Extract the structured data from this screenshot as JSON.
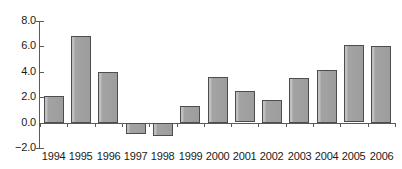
{
  "chart_data": {
    "type": "bar",
    "title": "",
    "subtitle": "",
    "xlabel": "",
    "ylabel": "",
    "categories": [
      "1994",
      "1995",
      "1996",
      "1997",
      "1998",
      "1999",
      "2000",
      "2001",
      "2002",
      "2003",
      "2004",
      "2005",
      "2006"
    ],
    "values": [
      2.1,
      6.85,
      4.0,
      -0.85,
      -1.0,
      1.3,
      3.6,
      2.45,
      1.8,
      3.55,
      4.15,
      6.1,
      6.05
    ],
    "series": [
      {
        "name": "",
        "values": [
          2.1,
          6.85,
          4.0,
          -0.85,
          -1.0,
          1.3,
          3.6,
          2.45,
          1.8,
          3.55,
          4.15,
          6.1,
          6.05
        ]
      }
    ],
    "ylim": [
      -2.0,
      8.0
    ],
    "ytick_values": [
      8.0,
      6.0,
      4.0,
      2.0,
      0.0,
      -2.0
    ],
    "ytick_labels": [
      "8.0",
      "6.0",
      "4.0",
      "2.0",
      "0.0",
      "−2.0"
    ],
    "grid": false,
    "legend": false,
    "legend_position": "none",
    "annotations": [],
    "bar_color": "#a3a3a3",
    "bar_edge_color": "#4d4d4d",
    "axis_color": "#5a5a5a",
    "background_color": "#ffffff",
    "text_color": "#1a1a1a"
  }
}
